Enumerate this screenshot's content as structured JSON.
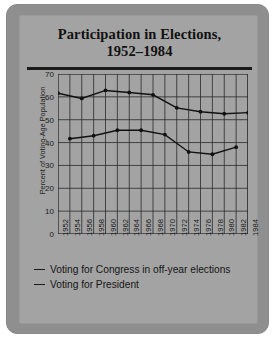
{
  "chart_data": {
    "type": "line",
    "title": "Participation in Elections, 1952–1984",
    "title_line1": "Participation in Elections,",
    "title_line2": "1952–1984",
    "xlabel": "",
    "ylabel": "Percent of Voting-Age Population",
    "ylim": [
      0,
      70
    ],
    "yticks": [
      70,
      60,
      50,
      40,
      30,
      20,
      10,
      0
    ],
    "grid": true,
    "legend_position": "below",
    "x": [
      "1952",
      "1954",
      "1956",
      "1958",
      "1960",
      "1962",
      "1964",
      "1966",
      "1968",
      "1970",
      "1972",
      "1974",
      "1976",
      "1978",
      "1980",
      "1982",
      "1984"
    ],
    "categories": [
      "1952",
      "1954",
      "1956",
      "1958",
      "1960",
      "1962",
      "1964",
      "1966",
      "1968",
      "1970",
      "1972",
      "1974",
      "1976",
      "1978",
      "1980",
      "1982",
      "1984"
    ],
    "series": [
      {
        "name": "Voting for President",
        "x": [
          "1952",
          "1956",
          "1960",
          "1964",
          "1968",
          "1972",
          "1976",
          "1980",
          "1984"
        ],
        "values": [
          61.6,
          59.3,
          62.8,
          61.9,
          60.9,
          55.2,
          53.5,
          52.6,
          53.1
        ]
      },
      {
        "name": "Voting for Congress in off-year elections",
        "x": [
          "1954",
          "1958",
          "1962",
          "1966",
          "1970",
          "1974",
          "1978",
          "1982"
        ],
        "values": [
          41.7,
          43.0,
          45.4,
          45.4,
          43.5,
          35.9,
          34.9,
          38.0
        ]
      }
    ]
  },
  "legend": {
    "items": [
      {
        "label": "Voting for Congress in off-year elections"
      },
      {
        "label": "Voting for President"
      }
    ]
  }
}
